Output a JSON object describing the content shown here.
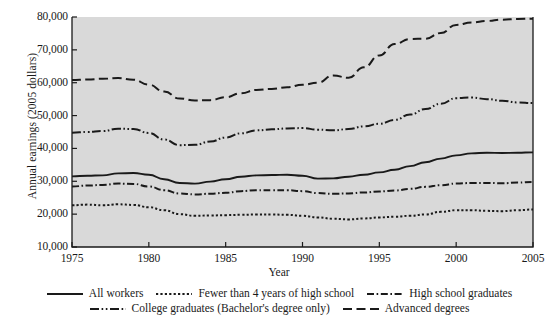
{
  "chart_data": {
    "type": "line",
    "title": "",
    "xlabel": "Year",
    "ylabel": "Annual earnings (2005 dollars)",
    "xlim": [
      1975,
      2005
    ],
    "ylim": [
      10000,
      80000
    ],
    "xticks": [
      1975,
      1980,
      1985,
      1990,
      1995,
      2000,
      2005
    ],
    "xticklabels": [
      "1975",
      "1980",
      "1985",
      "1990",
      "1995",
      "2000",
      "2005"
    ],
    "yticks": [
      10000,
      20000,
      30000,
      40000,
      50000,
      60000,
      70000,
      80000
    ],
    "yticklabels": [
      "10,000",
      "20,000",
      "30,000",
      "40,000",
      "50,000",
      "60,000",
      "70,000",
      "80,000"
    ],
    "grid": false,
    "plot_background": "#d9d9d9",
    "line_color": "#1a1a1a",
    "legend_position": "below",
    "x": [
      1975,
      1976,
      1977,
      1978,
      1979,
      1980,
      1981,
      1982,
      1983,
      1984,
      1985,
      1986,
      1987,
      1988,
      1989,
      1990,
      1991,
      1992,
      1993,
      1994,
      1995,
      1996,
      1997,
      1998,
      1999,
      2000,
      2001,
      2002,
      2003,
      2004,
      2005
    ],
    "series": [
      {
        "name": "All workers",
        "style": "solid",
        "values": [
          31500,
          31700,
          31800,
          32400,
          32500,
          32000,
          30600,
          29500,
          29300,
          29900,
          30600,
          31400,
          31800,
          31900,
          32000,
          31700,
          30800,
          30900,
          31400,
          32000,
          32700,
          33500,
          34600,
          35800,
          36900,
          37900,
          38500,
          38700,
          38600,
          38700,
          38800
        ]
      },
      {
        "name": "Fewer than 4 years of high school",
        "style": "dotted",
        "values": [
          22700,
          22900,
          22700,
          23000,
          22800,
          22100,
          21200,
          20000,
          19500,
          19600,
          19700,
          19800,
          19900,
          19900,
          19800,
          19500,
          19000,
          18600,
          18400,
          18700,
          19000,
          19200,
          19500,
          19900,
          20700,
          21200,
          21200,
          21000,
          20900,
          21200,
          21400
        ]
      },
      {
        "name": "High school graduates",
        "style": "dashdot",
        "values": [
          28400,
          28700,
          28900,
          29300,
          29200,
          28400,
          27300,
          26300,
          26000,
          26200,
          26500,
          27000,
          27300,
          27300,
          27300,
          27000,
          26400,
          26200,
          26300,
          26600,
          26900,
          27200,
          27700,
          28300,
          28800,
          29300,
          29500,
          29500,
          29400,
          29600,
          29800
        ]
      },
      {
        "name": "College graduates (Bachelor's degree only)",
        "style": "dashdotdot",
        "values": [
          44800,
          45000,
          45300,
          46000,
          45900,
          44700,
          42700,
          41000,
          41100,
          42100,
          43300,
          44600,
          45500,
          45800,
          46100,
          46200,
          45700,
          45500,
          45900,
          46700,
          47500,
          48700,
          50300,
          52000,
          53600,
          55300,
          55500,
          55000,
          54500,
          54000,
          53800
        ]
      },
      {
        "name": "Advanced degrees",
        "style": "dashed",
        "values": [
          60800,
          61000,
          61200,
          61400,
          60900,
          59400,
          57300,
          55200,
          54600,
          54700,
          55600,
          56800,
          57800,
          58100,
          58600,
          59400,
          60000,
          62200,
          61500,
          64700,
          68300,
          71800,
          73300,
          73400,
          75100,
          77600,
          78300,
          78800,
          79200,
          79400,
          79500
        ]
      }
    ]
  },
  "legend": {
    "rows": [
      [
        {
          "label": "All workers",
          "style": "solid"
        },
        {
          "label": "Fewer than 4 years of high school",
          "style": "dotted"
        },
        {
          "label": "High school graduates",
          "style": "dashdot"
        }
      ],
      [
        {
          "label": "College graduates (Bachelor's degree only)",
          "style": "dashdotdot"
        },
        {
          "label": "Advanced degrees",
          "style": "dashed"
        }
      ]
    ]
  }
}
